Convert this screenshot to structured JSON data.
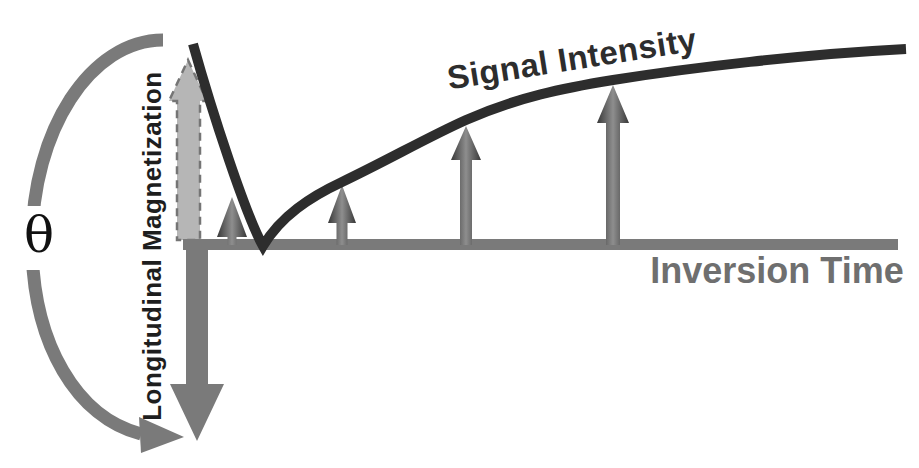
{
  "labels": {
    "angle": "θ",
    "y_axis": "Longitudinal Magnetization",
    "x_axis": "Inversion Time",
    "curve": "Signal Intensity"
  },
  "colors": {
    "gray": "#7a7a7a",
    "dark_line": "#2d2d2d",
    "light_gray_fill": "#b6b6b6",
    "dashed_border": "#757575",
    "x_label_gray": "#6f6f6f",
    "dark_text": "#1e1e1e"
  },
  "diagram": {
    "baseline_y": 245,
    "null_point_x": 263,
    "curve_start": {
      "x": 193,
      "y": 44
    },
    "curve_end": {
      "x": 906,
      "y": 49
    },
    "recovery_arrows": [
      {
        "x": 232,
        "tip_y": 197,
        "head_h": 40,
        "head_half_w": 15,
        "shaft_w": 9
      },
      {
        "x": 342,
        "tip_y": 185,
        "head_h": 38,
        "head_half_w": 14,
        "shaft_w": 11
      },
      {
        "x": 466,
        "tip_y": 126,
        "head_h": 34,
        "head_half_w": 15,
        "shaft_w": 12
      },
      {
        "x": 613,
        "tip_y": 85,
        "head_h": 38,
        "head_half_w": 16,
        "shaft_w": 14
      }
    ]
  }
}
